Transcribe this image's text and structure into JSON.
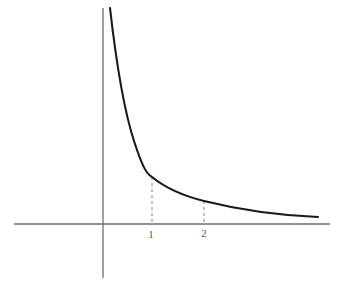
{
  "figure": {
    "name": "reciprocal-decay-curve",
    "background_color": "#ffffff",
    "width": 354,
    "height": 293
  },
  "axes": {
    "origin": {
      "x": 103,
      "y": 224
    },
    "unit_px": 51,
    "color": "#6e6e72",
    "stroke_width": 1.3,
    "x_axis": {
      "x_start": 14,
      "x_end": 330,
      "y": 224,
      "label": "",
      "arrow": false
    },
    "y_axis": {
      "y_start": 8,
      "y_end": 278,
      "x": 103,
      "label": "",
      "arrow": false
    }
  },
  "guides": {
    "color": "#9a9a9e",
    "stroke_width": 1.2,
    "dash": "3 3",
    "items": [
      {
        "name": "guide-x-1",
        "x_value": 1,
        "x_px": 152,
        "y_top_px": 177,
        "y_bottom_px": 224
      },
      {
        "name": "guide-x-2",
        "x_value": 2,
        "x_px": 204,
        "y_top_px": 201,
        "y_bottom_px": 224
      }
    ]
  },
  "ticks": [
    {
      "name": "tick-label-1",
      "label": "1",
      "x_px": 151,
      "y_px": 229
    },
    {
      "name": "tick-label-2",
      "label": "2",
      "x_px": 204,
      "y_px": 228
    }
  ],
  "curve": {
    "name": "decay-curve",
    "color": "#1a1a1a",
    "stroke_width": 2.1,
    "path": "M 110 8 C 115 52, 122 104, 134 141 C 143 169, 147 174, 152 177 C 163 186, 180 195, 204 201 C 236 209, 272 215, 318 217"
  },
  "chart_data": {
    "type": "line",
    "title": "",
    "subtitle": "",
    "xlabel": "",
    "ylabel": "",
    "grid": false,
    "legend": null,
    "annotations": [
      "dashed guide line at x = 1",
      "dashed guide line at x = 2"
    ],
    "xlim": [
      -1.75,
      4.45
    ],
    "ylim": [
      -1.05,
      4.25
    ],
    "xticks": [
      1,
      2
    ],
    "xticklabels": [
      "1",
      "2"
    ],
    "yticks": [],
    "yticklabels": [],
    "function": "y = 1/x",
    "x": [
      0.15,
      0.2,
      0.25,
      0.3,
      0.35,
      0.4,
      0.5,
      0.6,
      0.7,
      0.8,
      0.9,
      1.0,
      1.2,
      1.4,
      1.6,
      1.8,
      2.0,
      2.4,
      2.8,
      3.2,
      3.6,
      4.0,
      4.2
    ],
    "y": [
      4.24,
      4.0,
      3.4,
      2.9,
      2.5,
      2.2,
      1.85,
      1.55,
      1.3,
      1.15,
      1.03,
      0.92,
      0.76,
      0.63,
      0.55,
      0.49,
      0.45,
      0.35,
      0.26,
      0.2,
      0.16,
      0.14,
      0.13
    ]
  }
}
